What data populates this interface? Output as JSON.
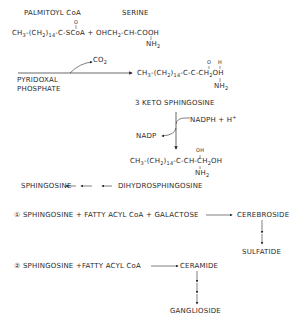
{
  "reactants": {
    "palmitoyl_coa_label": "PALMITOYL CoA",
    "serine_label": "SERINE",
    "palmitoyl_formula": "CH3-(CH2)14-C(=O)-SCoA",
    "palmitoyl_parts": {
      "a": "CH",
      "a_sub": "3",
      "b": "-(CH",
      "b_sub": "2",
      "c": ")",
      "c_sub": "14",
      "d": "-C-SCoA",
      "carbonyl": "O"
    },
    "plus": "+",
    "serine_parts": {
      "a": "OHCH",
      "a_sub": "2",
      "b": "-CH-COOH",
      "amine": "NH",
      "amine_sub": "2"
    }
  },
  "step1": {
    "byproduct": "CO2",
    "byproduct_parts": {
      "a": "CO",
      "a_sub": "2"
    },
    "cofactor_line1": "PYRIDOXAL",
    "cofactor_line2": "PHOSPHATE",
    "product_formula": "CH3-(CH2)14-C(=O)-CH(NH2)-CH2OH",
    "product_parts": {
      "a": "CH",
      "a_sub": "3",
      "b": "-(CH",
      "b_sub": "2",
      "c": ")",
      "c_sub": "14",
      "d": "-C-C-CH",
      "d_sub": "2",
      "e": "OH",
      "o": "O",
      "h": "H",
      "amine": "NH",
      "amine_sub": "2"
    },
    "product_label": "3 KETO SPHINGOSINE"
  },
  "step2": {
    "cofactor_in": "NADPH + H+",
    "cofactor_in_parts": {
      "a": "NADPH + H",
      "sup": "+"
    },
    "cofactor_out": "NADP",
    "product_formula": "CH3-(CH2)14-C(OH)-CH(NH2)-CH2OH",
    "product_parts": {
      "a": "CH",
      "a_sub": "3",
      "b": "-(CH",
      "b_sub": "2",
      "c": ")",
      "c_sub": "14",
      "d": "-C-CH-CH",
      "d_sub": "2",
      "e": "OH",
      "oh": "OH",
      "amine": "NH",
      "amine_sub": "2"
    }
  },
  "step3": {
    "left": "SPHINGOSINE",
    "right": "DIHYDROSPHINGOSINE"
  },
  "pathway1": {
    "number": "①",
    "reaction": "SPHINGOSINE + FATTY ACYL CoA + GALACTOSE",
    "product": "CEREBROSIDE",
    "final": "SULFATIDE"
  },
  "pathway2": {
    "number": "②",
    "reaction": "SPHINGOSINE +FATTY ACYL CoA",
    "product": "CERAMIDE",
    "final": "GANGLIOSIDE"
  },
  "colors": {
    "ink": "#2a2a2a",
    "background": "#ffffff"
  }
}
